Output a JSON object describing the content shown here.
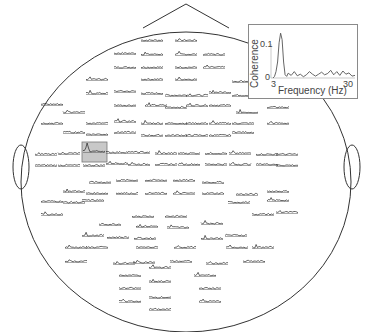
{
  "chart_data": {
    "type": "line",
    "title": "",
    "head": {
      "outline": "circle with nose triangle at top and ears at left/right",
      "center": [
        186,
        182
      ],
      "radius_x": 165,
      "radius_y": 150
    },
    "highlighted_electrode": {
      "box": [
        82,
        142,
        25,
        20
      ],
      "fill": "#c8c8c8"
    },
    "inset": {
      "xlabel": "Frequency (Hz)",
      "ylabel": "Coherence",
      "xticks": [
        "3",
        "30"
      ],
      "yticks": [
        "0",
        "0.1"
      ],
      "xlim": [
        3,
        30
      ],
      "ylim": [
        -0.01,
        0.16
      ],
      "x": [
        3,
        3.5,
        4,
        4.5,
        5,
        5.5,
        6,
        6.5,
        7,
        7.5,
        8,
        9,
        10,
        11,
        12,
        13,
        14,
        15,
        16,
        17,
        18,
        19,
        20,
        21,
        22,
        23,
        24,
        25,
        26,
        27,
        28,
        29,
        30
      ],
      "values": [
        0.0,
        0.005,
        0.02,
        0.05,
        0.11,
        0.14,
        0.12,
        0.05,
        0.01,
        0.005,
        0.015,
        0.008,
        0.02,
        0.007,
        0.012,
        0.004,
        0.01,
        0.02,
        0.012,
        0.006,
        0.012,
        0.018,
        0.01,
        0.014,
        0.024,
        0.01,
        0.02,
        0.008,
        0.022,
        0.012,
        0.016,
        0.006,
        0.008
      ]
    },
    "electrodes": [
      [
        152,
        41
      ],
      [
        186,
        41
      ],
      [
        125,
        54
      ],
      [
        152,
        55
      ],
      [
        186,
        55
      ],
      [
        214,
        55
      ],
      [
        125,
        68
      ],
      [
        152,
        68
      ],
      [
        186,
        68
      ],
      [
        214,
        68
      ],
      [
        97,
        80
      ],
      [
        152,
        80
      ],
      [
        186,
        80
      ],
      [
        243,
        82
      ],
      [
        97,
        94
      ],
      [
        125,
        92
      ],
      [
        152,
        94
      ],
      [
        176,
        96
      ],
      [
        197,
        96
      ],
      [
        220,
        93
      ],
      [
        243,
        96
      ],
      [
        52,
        105
      ],
      [
        125,
        106
      ],
      [
        156,
        106
      ],
      [
        176,
        108
      ],
      [
        197,
        106
      ],
      [
        220,
        106
      ],
      [
        278,
        108
      ],
      [
        74,
        113
      ],
      [
        247,
        113
      ],
      [
        52,
        124
      ],
      [
        97,
        124
      ],
      [
        125,
        122
      ],
      [
        152,
        124
      ],
      [
        176,
        124
      ],
      [
        197,
        124
      ],
      [
        220,
        124
      ],
      [
        243,
        124
      ],
      [
        278,
        124
      ],
      [
        74,
        133
      ],
      [
        97,
        135
      ],
      [
        125,
        133
      ],
      [
        152,
        136
      ],
      [
        176,
        136
      ],
      [
        197,
        136
      ],
      [
        220,
        136
      ],
      [
        243,
        133
      ],
      [
        46,
        155
      ],
      [
        69,
        154
      ],
      [
        94,
        152
      ],
      [
        117,
        153
      ],
      [
        139,
        153
      ],
      [
        166,
        154
      ],
      [
        189,
        154
      ],
      [
        216,
        154
      ],
      [
        240,
        154
      ],
      [
        267,
        155
      ],
      [
        287,
        155
      ],
      [
        46,
        166
      ],
      [
        69,
        166
      ],
      [
        94,
        166
      ],
      [
        117,
        164
      ],
      [
        139,
        165
      ],
      [
        166,
        165
      ],
      [
        189,
        165
      ],
      [
        216,
        165
      ],
      [
        240,
        165
      ],
      [
        267,
        165
      ],
      [
        287,
        166
      ],
      [
        100,
        183
      ],
      [
        127,
        181
      ],
      [
        156,
        181
      ],
      [
        184,
        181
      ],
      [
        213,
        183
      ],
      [
        74,
        192
      ],
      [
        97,
        194
      ],
      [
        127,
        194
      ],
      [
        156,
        194
      ],
      [
        184,
        194
      ],
      [
        213,
        194
      ],
      [
        247,
        195
      ],
      [
        278,
        192
      ],
      [
        52,
        202
      ],
      [
        74,
        203
      ],
      [
        93,
        201
      ],
      [
        239,
        203
      ],
      [
        278,
        201
      ],
      [
        52,
        215
      ],
      [
        263,
        215
      ],
      [
        287,
        213
      ],
      [
        143,
        217
      ],
      [
        176,
        217
      ],
      [
        110,
        225
      ],
      [
        147,
        227
      ],
      [
        178,
        228
      ],
      [
        212,
        224
      ],
      [
        93,
        236
      ],
      [
        118,
        238
      ],
      [
        145,
        239
      ],
      [
        212,
        239
      ],
      [
        236,
        236
      ],
      [
        76,
        248
      ],
      [
        97,
        248
      ],
      [
        147,
        248
      ],
      [
        185,
        248
      ],
      [
        237,
        248
      ],
      [
        263,
        248
      ],
      [
        76,
        262
      ],
      [
        124,
        264
      ],
      [
        144,
        263
      ],
      [
        181,
        262
      ],
      [
        217,
        264
      ],
      [
        254,
        262
      ],
      [
        160,
        268
      ],
      [
        130,
        276
      ],
      [
        205,
        276
      ],
      [
        160,
        282
      ],
      [
        130,
        289
      ],
      [
        210,
        289
      ],
      [
        160,
        298
      ],
      [
        130,
        302
      ],
      [
        210,
        302
      ],
      [
        160,
        310
      ]
    ]
  }
}
